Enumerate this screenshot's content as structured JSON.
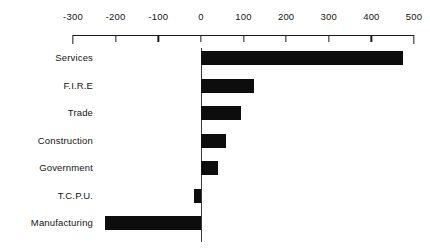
{
  "chart_data": {
    "type": "bar",
    "orientation": "horizontal",
    "title": "",
    "subtitle": "",
    "xlabel": "",
    "ylabel": "",
    "categories": [
      "Services",
      "F.I.R.E",
      "Trade",
      "Construction",
      "Government",
      "T.C.P.U.",
      "Manufacturing"
    ],
    "values": [
      475,
      125,
      95,
      60,
      40,
      -15,
      -225
    ],
    "series": [
      {
        "name": "Change",
        "values": [
          475,
          125,
          95,
          60,
          40,
          -15,
          -225
        ]
      }
    ],
    "xlim": [
      -300,
      500
    ],
    "xticks": [
      -300,
      -200,
      -100,
      0,
      100,
      200,
      300,
      400,
      500
    ],
    "xtick_labels": [
      "-300",
      "-200",
      "-100",
      "0",
      "100",
      "200",
      "300",
      "400",
      "500"
    ],
    "axis_position": "top",
    "grid": false,
    "legend": false,
    "bar_color": "#0d0d0d",
    "background_color": "#ffffff"
  }
}
